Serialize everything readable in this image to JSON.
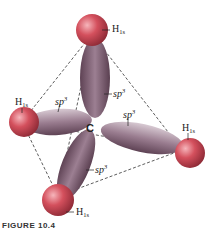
{
  "figure": {
    "center_atom": "C",
    "h_labels": [
      {
        "base": "H",
        "sub": "1s"
      },
      {
        "base": "H",
        "sub": "1s"
      },
      {
        "base": "H",
        "sub": "1s"
      },
      {
        "base": "H",
        "sub": "1s"
      }
    ],
    "orbital_labels": [
      {
        "base": "sp",
        "sup": "3"
      },
      {
        "base": "sp",
        "sup": "3"
      },
      {
        "base": "sp",
        "sup": "3"
      },
      {
        "base": "sp",
        "sup": "3"
      }
    ],
    "caption": "FIGURE 10.4"
  },
  "colors": {
    "lobe": "#7a5a6e",
    "lobe_light": "#c9b8c4",
    "h_sphere": "#c8404e",
    "h_sphere_light": "#f2a0a8",
    "dashes": "#333333"
  }
}
